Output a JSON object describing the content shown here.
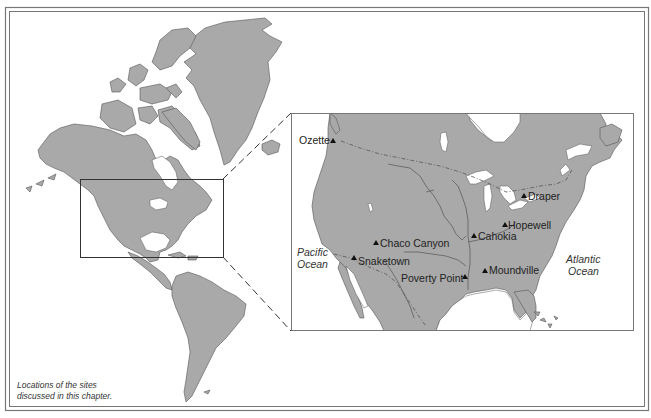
{
  "figure": {
    "caption_line1": "Locations of the sites",
    "caption_line2": "discussed in this chapter.",
    "colors": {
      "land": "#a9a9a9",
      "coast": "#555555",
      "background": "#ffffff",
      "frame": "#666666"
    }
  },
  "inset": {
    "oceans": [
      {
        "line1": "Pacific",
        "line2": "Ocean"
      },
      {
        "line1": "Atlantic",
        "line2": "Ocean"
      }
    ],
    "sites": [
      {
        "name": "Ozette",
        "marker": "triangle-icon"
      },
      {
        "name": "Draper",
        "marker": "triangle-icon"
      },
      {
        "name": "Hopewell",
        "marker": "triangle-icon"
      },
      {
        "name": "Cahokia",
        "marker": "triangle-icon"
      },
      {
        "name": "Chaco Canyon",
        "marker": "triangle-icon"
      },
      {
        "name": "Snaketown",
        "marker": "triangle-icon"
      },
      {
        "name": "Poverty Point",
        "marker": "triangle-icon"
      },
      {
        "name": "Moundville",
        "marker": "triangle-icon"
      }
    ]
  }
}
